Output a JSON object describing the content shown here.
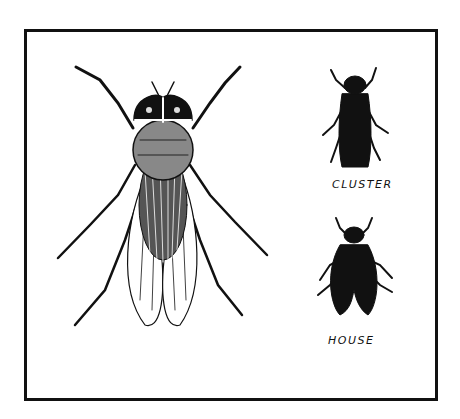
{
  "illustration": {
    "subject": "fly comparison",
    "main_figure": "detailed-fly-drawing",
    "labels": {
      "cluster": "CLUSTER",
      "house": "HOUSE"
    },
    "colors": {
      "ink": "#111111",
      "paper": "#ffffff"
    }
  }
}
